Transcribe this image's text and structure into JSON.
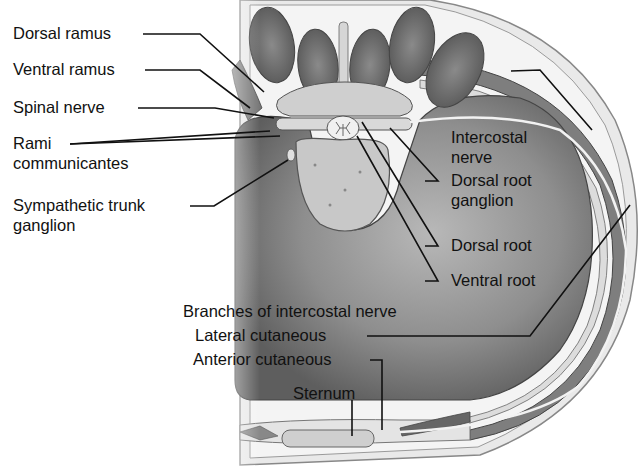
{
  "figure": {
    "type": "anatomical cross-section of thorax showing intercostal nerve pathway",
    "colors": {
      "background": "#ffffff",
      "cavity_dark": "#6e6e6e",
      "cavity_light": "#c8c8c8",
      "muscle": "#7a7a7a",
      "bone": "#cfcfcf",
      "outline": "#555555",
      "leader": "#111111"
    }
  },
  "labels": {
    "dorsal_ramus": "Dorsal ramus",
    "ventral_ramus": "Ventral ramus",
    "spinal_nerve": "Spinal nerve",
    "rami_line1": "Rami",
    "rami_line2": "communicantes",
    "sympathetic_line1": "Sympathetic trunk",
    "sympathetic_line2": "ganglion",
    "intercostal_line1": "Intercostal",
    "intercostal_line2": "nerve",
    "drg_line1": "Dorsal root",
    "drg_line2": "ganglion",
    "dorsal_root": "Dorsal root",
    "ventral_root": "Ventral root",
    "branches_heading": "Branches of intercostal nerve",
    "lateral_cutaneous": "Lateral cutaneous",
    "anterior_cutaneous": "Anterior cutaneous",
    "sternum": "Sternum"
  }
}
